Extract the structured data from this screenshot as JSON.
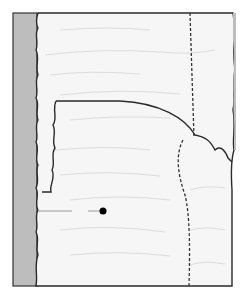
{
  "diagram": {
    "type": "cross-section illustration",
    "colors": {
      "background": "#ffffff",
      "block_fill": "#f6f6f6",
      "backing_strip": "#bdbdbd",
      "outline": "#2a2a2a",
      "grain": "#dcdcdc",
      "dashed_line": "#333333",
      "pointer_line": "#9a9a9a",
      "pointer_dot": "#000000"
    },
    "elements": [
      {
        "name": "backing-strip",
        "label": ""
      },
      {
        "name": "main-block",
        "label": ""
      },
      {
        "name": "inner-panel",
        "label": ""
      },
      {
        "name": "vertical-dashed-cut",
        "label": ""
      },
      {
        "name": "curved-dashed-cut",
        "label": ""
      },
      {
        "name": "pointer-line",
        "label": ""
      },
      {
        "name": "pointer-dot",
        "label": ""
      }
    ]
  }
}
